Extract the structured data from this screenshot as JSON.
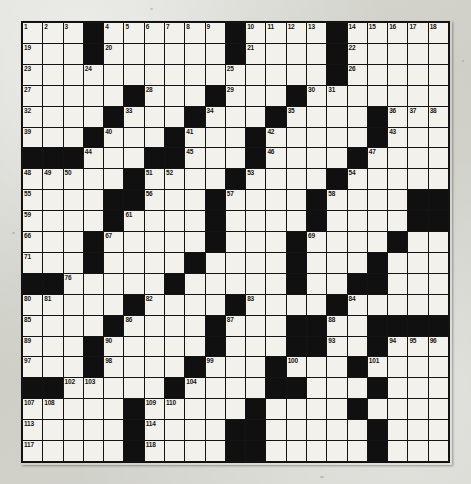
{
  "puzzle": {
    "title": "Crossword Puzzle Grid",
    "type": "crossword-grid",
    "rows": 21,
    "cols": 21,
    "colors": {
      "block": "#111010",
      "cell": "#f2f1ec",
      "grid_line": "#141414",
      "number_text": "#17150f",
      "paper": "#d2d2cc"
    },
    "max_clue_number": 120,
    "block_layout_note": "Each row string uses '#' for a black square and '.' for a white square.",
    "grid": [
      "...#......#....#.....",
      "...#......#....#.....",
      "...............#.....",
      ".....#...#...#.......",
      "....#...#...#....#...",
      "...#...#...#.....#...",
      "###...##...#....#....",
      ".....#....#....#.....",
      "....##...#....#....##",
      "....#....#....#....##",
      "...#.....#...#....#..",
      "...#....#....#...#...",
      "##.....#.....#..##...",
      ".....#....#....#.....",
      "....#....#...##..####",
      "...#.....#...##..#...",
      "...#....#...#...#....",
      "##.....#....##...#...",
      ".....#.....#....#....",
      ".....#....##.....#...",
      ".....#....##.....#..."
    ],
    "numbers": [
      {
        "n": 1,
        "row": 1,
        "col": 1
      },
      {
        "n": 2,
        "row": 1,
        "col": 2
      },
      {
        "n": 3,
        "row": 1,
        "col": 3
      },
      {
        "n": 4,
        "row": 1,
        "col": 5
      },
      {
        "n": 5,
        "row": 1,
        "col": 6
      },
      {
        "n": 6,
        "row": 1,
        "col": 7
      },
      {
        "n": 7,
        "row": 1,
        "col": 8
      },
      {
        "n": 8,
        "row": 1,
        "col": 9
      },
      {
        "n": 9,
        "row": 1,
        "col": 10
      },
      {
        "n": 10,
        "row": 1,
        "col": 12
      },
      {
        "n": 11,
        "row": 1,
        "col": 13
      },
      {
        "n": 12,
        "row": 1,
        "col": 14
      },
      {
        "n": 13,
        "row": 1,
        "col": 15
      },
      {
        "n": 14,
        "row": 1,
        "col": 17
      },
      {
        "n": 15,
        "row": 1,
        "col": 18
      },
      {
        "n": 16,
        "row": 1,
        "col": 19
      },
      {
        "n": 17,
        "row": 1,
        "col": 20
      },
      {
        "n": 18,
        "row": 1,
        "col": 21
      },
      {
        "n": 19,
        "row": 2,
        "col": 1
      },
      {
        "n": 20,
        "row": 2,
        "col": 5
      },
      {
        "n": 21,
        "row": 2,
        "col": 12
      },
      {
        "n": 22,
        "row": 2,
        "col": 17
      },
      {
        "n": 23,
        "row": 3,
        "col": 1
      },
      {
        "n": 24,
        "row": 3,
        "col": 4
      },
      {
        "n": 25,
        "row": 3,
        "col": 11
      },
      {
        "n": 26,
        "row": 3,
        "col": 17
      },
      {
        "n": 27,
        "row": 4,
        "col": 1
      },
      {
        "n": 28,
        "row": 4,
        "col": 7
      },
      {
        "n": 29,
        "row": 4,
        "col": 11
      },
      {
        "n": 30,
        "row": 4,
        "col": 15
      },
      {
        "n": 31,
        "row": 4,
        "col": 16
      },
      {
        "n": 32,
        "row": 5,
        "col": 1
      },
      {
        "n": 33,
        "row": 5,
        "col": 6
      },
      {
        "n": 34,
        "row": 5,
        "col": 10
      },
      {
        "n": 35,
        "row": 5,
        "col": 14
      },
      {
        "n": 36,
        "row": 5,
        "col": 19
      },
      {
        "n": 37,
        "row": 5,
        "col": 20
      },
      {
        "n": 38,
        "row": 5,
        "col": 21
      },
      {
        "n": 39,
        "row": 6,
        "col": 1
      },
      {
        "n": 40,
        "row": 6,
        "col": 5
      },
      {
        "n": 41,
        "row": 6,
        "col": 9
      },
      {
        "n": 42,
        "row": 6,
        "col": 13
      },
      {
        "n": 43,
        "row": 6,
        "col": 19
      },
      {
        "n": 44,
        "row": 7,
        "col": 4
      },
      {
        "n": 45,
        "row": 7,
        "col": 9
      },
      {
        "n": 46,
        "row": 7,
        "col": 13
      },
      {
        "n": 47,
        "row": 7,
        "col": 18
      },
      {
        "n": 48,
        "row": 8,
        "col": 1
      },
      {
        "n": 49,
        "row": 8,
        "col": 2
      },
      {
        "n": 50,
        "row": 8,
        "col": 3
      },
      {
        "n": 51,
        "row": 8,
        "col": 7
      },
      {
        "n": 52,
        "row": 8,
        "col": 8
      },
      {
        "n": 53,
        "row": 8,
        "col": 12
      },
      {
        "n": 54,
        "row": 8,
        "col": 17
      },
      {
        "n": 55,
        "row": 9,
        "col": 1
      },
      {
        "n": 56,
        "row": 9,
        "col": 7
      },
      {
        "n": 57,
        "row": 9,
        "col": 11
      },
      {
        "n": 58,
        "row": 9,
        "col": 16
      },
      {
        "n": 59,
        "row": 10,
        "col": 1
      },
      {
        "n": 60,
        "row": 10,
        "col": 5
      },
      {
        "n": 61,
        "row": 10,
        "col": 6
      },
      {
        "n": 62,
        "row": 10,
        "col": 10
      },
      {
        "n": 63,
        "row": 10,
        "col": 15
      },
      {
        "n": 64,
        "row": 10,
        "col": 20
      },
      {
        "n": 65,
        "row": 10,
        "col": 21
      },
      {
        "n": 66,
        "row": 11,
        "col": 1
      },
      {
        "n": 67,
        "row": 11,
        "col": 5
      },
      {
        "n": 68,
        "row": 11,
        "col": 10
      },
      {
        "n": 69,
        "row": 11,
        "col": 15
      },
      {
        "n": 70,
        "row": 11,
        "col": 19
      },
      {
        "n": 71,
        "row": 12,
        "col": 1
      },
      {
        "n": 72,
        "row": 12,
        "col": 4
      },
      {
        "n": 73,
        "row": 12,
        "col": 9
      },
      {
        "n": 74,
        "row": 12,
        "col": 14
      },
      {
        "n": 75,
        "row": 12,
        "col": 18
      },
      {
        "n": 76,
        "row": 13,
        "col": 3
      },
      {
        "n": 77,
        "row": 13,
        "col": 8
      },
      {
        "n": 78,
        "row": 13,
        "col": 14
      },
      {
        "n": 79,
        "row": 13,
        "col": 18
      },
      {
        "n": 80,
        "row": 14,
        "col": 1
      },
      {
        "n": 81,
        "row": 14,
        "col": 2
      },
      {
        "n": 82,
        "row": 14,
        "col": 7
      },
      {
        "n": 83,
        "row": 14,
        "col": 12
      },
      {
        "n": 84,
        "row": 14,
        "col": 17
      },
      {
        "n": 85,
        "row": 15,
        "col": 1
      },
      {
        "n": 86,
        "row": 15,
        "col": 6
      },
      {
        "n": 87,
        "row": 15,
        "col": 11
      },
      {
        "n": 88,
        "row": 15,
        "col": 16
      },
      {
        "n": 89,
        "row": 16,
        "col": 1
      },
      {
        "n": 90,
        "row": 16,
        "col": 5
      },
      {
        "n": 91,
        "row": 16,
        "col": 10
      },
      {
        "n": 92,
        "row": 16,
        "col": 15
      },
      {
        "n": 93,
        "row": 16,
        "col": 16
      },
      {
        "n": 94,
        "row": 16,
        "col": 19
      },
      {
        "n": 95,
        "row": 16,
        "col": 20
      },
      {
        "n": 96,
        "row": 16,
        "col": 21
      },
      {
        "n": 97,
        "row": 17,
        "col": 1
      },
      {
        "n": 98,
        "row": 17,
        "col": 5
      },
      {
        "n": 99,
        "row": 17,
        "col": 10
      },
      {
        "n": 100,
        "row": 17,
        "col": 14
      },
      {
        "n": 101,
        "row": 17,
        "col": 18
      },
      {
        "n": 102,
        "row": 18,
        "col": 3
      },
      {
        "n": 103,
        "row": 18,
        "col": 4
      },
      {
        "n": 104,
        "row": 18,
        "col": 9
      },
      {
        "n": 105,
        "row": 18,
        "col": 14
      },
      {
        "n": 106,
        "row": 18,
        "col": 18
      },
      {
        "n": 107,
        "row": 19,
        "col": 1
      },
      {
        "n": 108,
        "row": 19,
        "col": 2
      },
      {
        "n": 109,
        "row": 19,
        "col": 7
      },
      {
        "n": 110,
        "row": 19,
        "col": 8
      },
      {
        "n": 111,
        "row": 19,
        "col": 12
      },
      {
        "n": 112,
        "row": 19,
        "col": 17
      },
      {
        "n": 113,
        "row": 20,
        "col": 1
      },
      {
        "n": 114,
        "row": 20,
        "col": 7
      },
      {
        "n": 115,
        "row": 20,
        "col": 12
      },
      {
        "n": 116,
        "row": 20,
        "col": 18
      },
      {
        "n": 117,
        "row": 21,
        "col": 1
      },
      {
        "n": 118,
        "row": 21,
        "col": 7
      },
      {
        "n": 119,
        "row": 21,
        "col": 12
      },
      {
        "n": 120,
        "row": 21,
        "col": 18
      }
    ]
  }
}
